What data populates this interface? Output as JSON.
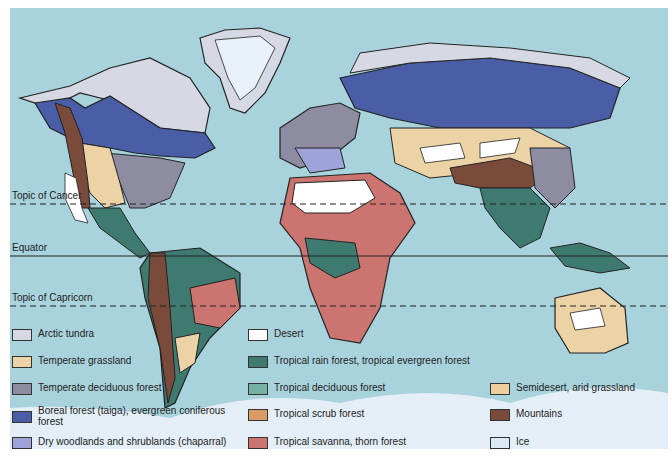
{
  "map": {
    "title": "World Biomes",
    "background_color": "#a9d3dc",
    "latitude_lines": [
      {
        "label": "Topic of Cancer",
        "style": "dashed"
      },
      {
        "label": "Equator",
        "style": "solid"
      },
      {
        "label": "Topic of Capricorn",
        "style": "dashed"
      }
    ]
  },
  "legend": {
    "items": [
      {
        "label": "Arctic tundra",
        "color": "#d6d8e4"
      },
      {
        "label": "Temperate grassland",
        "color": "#ecd3a6"
      },
      {
        "label": "Temperate deciduous forest",
        "color": "#8d8ca0"
      },
      {
        "label": "Boreal forest (taiga), evergreen coniferous forest",
        "color": "#4a5ea8"
      },
      {
        "label": "Dry woodlands and shrublands (chaparral)",
        "color": "#9ea3d8"
      },
      {
        "label": "Desert",
        "color": "#ffffff"
      },
      {
        "label": "Tropical rain forest, tropical evergreen forest",
        "color": "#3e7a70"
      },
      {
        "label": "Tropical deciduous forest",
        "color": "#74b3a1"
      },
      {
        "label": "Tropical scrub forest",
        "color": "#d99c66"
      },
      {
        "label": "Tropical savanna, thorn forest",
        "color": "#cc7470"
      },
      {
        "label": "Semidesert, arid grassland",
        "color": "#efcf9f"
      },
      {
        "label": "Mountains",
        "color": "#7a4a3a"
      },
      {
        "label": "Ice",
        "color": "#dbe9f5"
      }
    ]
  }
}
